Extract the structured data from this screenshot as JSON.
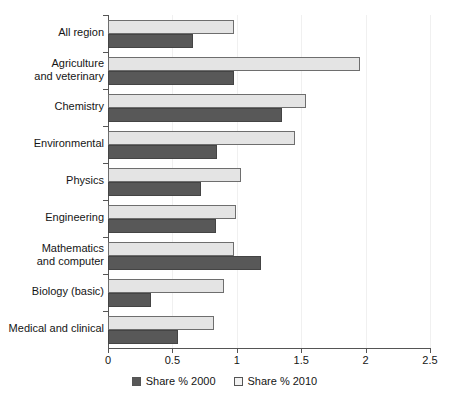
{
  "chart_data": {
    "type": "bar",
    "orientation": "horizontal",
    "title": "",
    "xlabel": "",
    "ylabel": "",
    "xlim": [
      0,
      2.5
    ],
    "xticks": [
      "0",
      "0.5",
      "1",
      "1.5",
      "2",
      "2.5"
    ],
    "xtick_values": [
      0,
      0.5,
      1,
      1.5,
      2,
      2.5
    ],
    "grid": false,
    "legend_position": "bottom",
    "categories": [
      "All region",
      "Agriculture\nand veterinary",
      "Chemistry",
      "Environmental",
      "Physics",
      "Engineering",
      "Mathematics\nand computer",
      "Biology (basic)",
      "Medical and clinical"
    ],
    "series": [
      {
        "name": "Share % 2000",
        "color": "#585858",
        "values": [
          0.66,
          0.98,
          1.35,
          0.85,
          0.72,
          0.84,
          1.19,
          0.33,
          0.54
        ]
      },
      {
        "name": "Share % 2010",
        "color": "#e4e4e4",
        "values": [
          0.98,
          1.96,
          1.54,
          1.45,
          1.03,
          0.99,
          0.98,
          0.9,
          0.82
        ]
      }
    ]
  },
  "legend": {
    "items": [
      {
        "label": "Share % 2000",
        "swatch": "dark"
      },
      {
        "label": "Share % 2010",
        "swatch": "light"
      }
    ]
  }
}
